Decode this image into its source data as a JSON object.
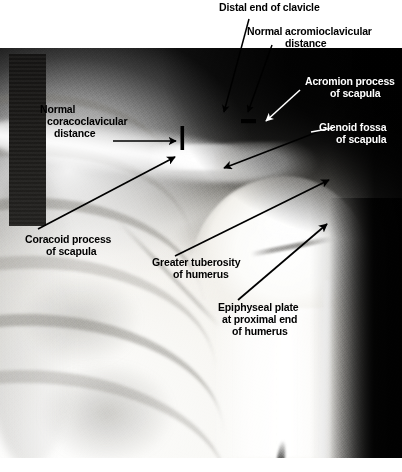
{
  "figure": {
    "type": "radiograph",
    "view": "anteroposterior",
    "caption": ""
  },
  "annotations": [
    {
      "id": "distal-clavicle",
      "label": "Distal end of clavicle",
      "lines": [
        "Distal end of clavicle"
      ],
      "color": "#000000",
      "on_plate": false,
      "leader": "arrow"
    },
    {
      "id": "acromioclavicular-distance",
      "label": "Normal acromioclavicular distance",
      "lines": [
        "Normal acromioclavicular",
        "distance"
      ],
      "color": "#000000",
      "on_plate": false,
      "leader": "arrow",
      "marker": "horizontal-bar"
    },
    {
      "id": "acromion-process",
      "label": "Acromion process of scapula",
      "lines": [
        "Acromion process",
        "of scapula"
      ],
      "color": "#ffffff",
      "on_plate": true,
      "leader": "arrow"
    },
    {
      "id": "glenoid-fossa",
      "label": "Glenoid fossa of scapula",
      "lines": [
        "Glenoid fossa",
        "of scapula"
      ],
      "color": "#ffffff",
      "on_plate": true,
      "leader": "arrow"
    },
    {
      "id": "coracoclavicular-distance",
      "label": "Normal coracoclavicular distance",
      "lines": [
        "Normal",
        "coracoclavicular",
        "distance"
      ],
      "color": "#000000",
      "on_plate": true,
      "leader": "arrow",
      "marker": "vertical-bar"
    },
    {
      "id": "coracoid-process",
      "label": "Coracoid process of scapula",
      "lines": [
        "Coracoid process",
        "of scapula"
      ],
      "color": "#000000",
      "on_plate": true,
      "leader": "arrow"
    },
    {
      "id": "greater-tuberosity",
      "label": "Greater tuberosity of humerus",
      "lines": [
        "Greater tuberosity",
        "of humerus"
      ],
      "color": "#000000",
      "on_plate": true,
      "leader": "arrow"
    },
    {
      "id": "epiphyseal-plate",
      "label": "Epiphyseal plate at proximal end of humerus",
      "lines": [
        "Epiphyseal plate",
        "at proximal end",
        "of humerus"
      ],
      "color": "#000000",
      "on_plate": true,
      "leader": "arrow"
    }
  ]
}
